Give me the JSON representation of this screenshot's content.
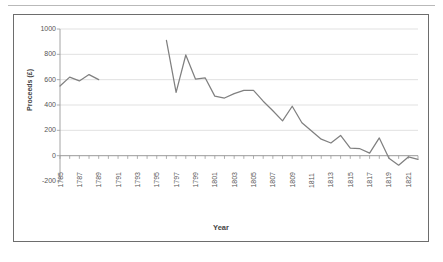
{
  "page": {
    "rule_color": "#b9b9b9",
    "frame_border_color": "#6d6d6d",
    "background": "#ffffff"
  },
  "chart_data": {
    "type": "line",
    "title": "",
    "xlabel": "Year",
    "ylabel": "Proceeds (£)",
    "line_color": "#808080",
    "grid": true,
    "grid_color": "#d9d9d9",
    "legend": "none",
    "ylim": [
      -200,
      1000
    ],
    "yticks": [
      1000,
      800,
      600,
      400,
      200,
      0,
      -200
    ],
    "xlim": [
      1785,
      1822
    ],
    "xticks": [
      1785,
      1787,
      1789,
      1791,
      1793,
      1795,
      1797,
      1799,
      1801,
      1803,
      1805,
      1807,
      1809,
      1811,
      1813,
      1815,
      1817,
      1819,
      1821
    ],
    "x": [
      1785,
      1786,
      1787,
      1788,
      1789,
      1790,
      1791,
      1792,
      1793,
      1794,
      1795,
      1796,
      1797,
      1798,
      1799,
      1800,
      1801,
      1802,
      1803,
      1804,
      1805,
      1806,
      1807,
      1808,
      1809,
      1810,
      1811,
      1812,
      1813,
      1814,
      1815,
      1816,
      1817,
      1818,
      1819,
      1820,
      1821,
      1822
    ],
    "values": [
      550,
      620,
      590,
      640,
      600,
      null,
      null,
      null,
      null,
      null,
      null,
      910,
      500,
      795,
      605,
      615,
      470,
      455,
      490,
      515,
      515,
      430,
      355,
      275,
      390,
      260,
      195,
      130,
      100,
      160,
      60,
      55,
      20,
      140,
      -20,
      -75,
      -10,
      -30
    ],
    "series_name": "Proceeds",
    "note_gap": "no data 1790-1795"
  }
}
